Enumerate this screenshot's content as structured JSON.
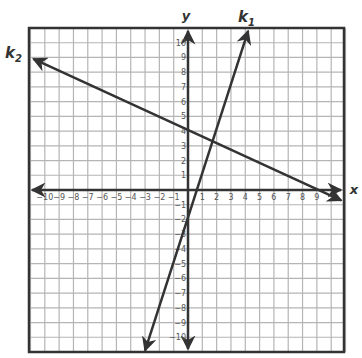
{
  "chart_data": {
    "type": "line",
    "title": "",
    "xlabel": "x",
    "ylabel": "y",
    "xlim": [
      -11,
      11
    ],
    "ylim": [
      -11,
      11
    ],
    "grid": true,
    "x_ticks": [
      -10,
      -9,
      -8,
      -7,
      -6,
      -5,
      -4,
      -3,
      -2,
      -1,
      1,
      2,
      3,
      4,
      5,
      6,
      7,
      8,
      9
    ],
    "y_ticks": [
      10,
      9,
      8,
      7,
      6,
      5,
      4,
      3,
      2,
      1,
      -1,
      -2,
      -3,
      -4,
      -5,
      -6,
      -7,
      -8,
      -9,
      -10
    ],
    "series": [
      {
        "name": "k1",
        "label_main": "k",
        "label_sub": "1",
        "equation_estimate": "y = 3x - 2",
        "points": [
          [
            -3.0,
            -10.9
          ],
          [
            4.2,
            10.8
          ]
        ],
        "y_intercept": -2,
        "color": "#333333"
      },
      {
        "name": "k2",
        "label_main": "k",
        "label_sub": "2",
        "equation_estimate": "y = -0.45x + 4",
        "points": [
          [
            -10.8,
            8.9
          ],
          [
            10.7,
            -0.7
          ]
        ],
        "y_intercept": 4,
        "color": "#333333"
      }
    ],
    "intersection_estimate": [
      1.8,
      3.2
    ]
  },
  "colors": {
    "grid": "#b5b5b5",
    "axis": "#333333",
    "border": "#333333",
    "line": "#333333"
  }
}
